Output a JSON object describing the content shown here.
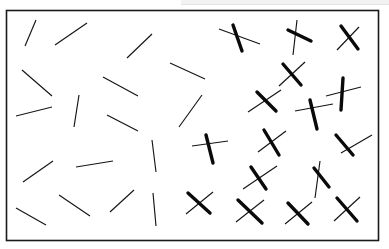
{
  "figure": {
    "canvas": {
      "width": 389,
      "height": 249
    },
    "background_color": "#ffffff",
    "top_band": {
      "name": "page-edge-band",
      "color": "#f2f2f2",
      "line_color": "#e2e2e2",
      "x": 181,
      "y": 0,
      "width": 208,
      "height": 5
    },
    "frame": {
      "name": "stimulus-frame",
      "x": 6.5,
      "y": 10.5,
      "width": 372,
      "height": 230,
      "stroke_color": "#1a1a1a",
      "stroke_width": 1.6,
      "fill_color": "#ffffff"
    },
    "stroke_styles": {
      "thin": {
        "color": "#141414",
        "width": 1.15
      },
      "thick": {
        "color": "#0a0a0a",
        "width": 3.4
      }
    },
    "region_labels": {
      "left": "single-line elements",
      "right": "cross (X) elements"
    }
  },
  "elements": {
    "thin_lines": [
      {
        "id": "line-01",
        "x1": 25,
        "y1": 46,
        "x2": 36,
        "y2": 20
      },
      {
        "id": "line-02",
        "x1": 55,
        "y1": 45,
        "x2": 87,
        "y2": 23
      },
      {
        "id": "line-03",
        "x1": 127,
        "y1": 58,
        "x2": 152,
        "y2": 34
      },
      {
        "id": "line-04",
        "x1": 170,
        "y1": 63,
        "x2": 205,
        "y2": 79
      },
      {
        "id": "line-05",
        "x1": 22,
        "y1": 70,
        "x2": 52,
        "y2": 96
      },
      {
        "id": "line-06",
        "x1": 103,
        "y1": 77,
        "x2": 138,
        "y2": 96
      },
      {
        "id": "line-07",
        "x1": 79,
        "y1": 95,
        "x2": 74,
        "y2": 127
      },
      {
        "id": "line-08",
        "x1": 16,
        "y1": 116,
        "x2": 52,
        "y2": 107
      },
      {
        "id": "line-09",
        "x1": 107,
        "y1": 115,
        "x2": 138,
        "y2": 131
      },
      {
        "id": "line-10",
        "x1": 179,
        "y1": 127,
        "x2": 202,
        "y2": 95
      },
      {
        "id": "line-11",
        "x1": 23,
        "y1": 182,
        "x2": 53,
        "y2": 161
      },
      {
        "id": "line-12",
        "x1": 76,
        "y1": 167,
        "x2": 113,
        "y2": 161
      },
      {
        "id": "line-13",
        "x1": 152,
        "y1": 140,
        "x2": 156,
        "y2": 172
      },
      {
        "id": "line-14",
        "x1": 16,
        "y1": 208,
        "x2": 46,
        "y2": 225
      },
      {
        "id": "line-15",
        "x1": 59,
        "y1": 195,
        "x2": 90,
        "y2": 216
      },
      {
        "id": "line-16",
        "x1": 110,
        "y1": 212,
        "x2": 134,
        "y2": 190
      },
      {
        "id": "line-17",
        "x1": 153,
        "y1": 193,
        "x2": 156,
        "y2": 226
      }
    ],
    "crosses": [
      {
        "id": "cross-01",
        "thick": {
          "x1": 233,
          "y1": 25,
          "x2": 242,
          "y2": 51
        },
        "thin": {
          "x1": 219,
          "y1": 29,
          "x2": 260,
          "y2": 44
        }
      },
      {
        "id": "cross-02",
        "thick": {
          "x1": 288,
          "y1": 30,
          "x2": 311,
          "y2": 41
        },
        "thin": {
          "x1": 297,
          "y1": 20,
          "x2": 293,
          "y2": 55
        }
      },
      {
        "id": "cross-03",
        "thick": {
          "x1": 341,
          "y1": 26,
          "x2": 358,
          "y2": 49
        },
        "thin": {
          "x1": 359,
          "y1": 27,
          "x2": 337,
          "y2": 50
        }
      },
      {
        "id": "cross-04",
        "thick": {
          "x1": 283,
          "y1": 64,
          "x2": 301,
          "y2": 85
        },
        "thin": {
          "x1": 305,
          "y1": 62,
          "x2": 279,
          "y2": 86
        }
      },
      {
        "id": "cross-05",
        "thick": {
          "x1": 257,
          "y1": 92,
          "x2": 276,
          "y2": 111
        },
        "thin": {
          "x1": 281,
          "y1": 90,
          "x2": 248,
          "y2": 112
        }
      },
      {
        "id": "cross-06",
        "thick": {
          "x1": 343,
          "y1": 78,
          "x2": 341,
          "y2": 110
        },
        "thin": {
          "x1": 326,
          "y1": 96,
          "x2": 361,
          "y2": 87
        }
      },
      {
        "id": "cross-07",
        "thick": {
          "x1": 310,
          "y1": 100,
          "x2": 317,
          "y2": 129
        },
        "thin": {
          "x1": 295,
          "y1": 111,
          "x2": 333,
          "y2": 104
        }
      },
      {
        "id": "cross-08",
        "thick": {
          "x1": 206,
          "y1": 135,
          "x2": 213,
          "y2": 163
        },
        "thin": {
          "x1": 192,
          "y1": 146,
          "x2": 228,
          "y2": 141
        }
      },
      {
        "id": "cross-09",
        "thick": {
          "x1": 264,
          "y1": 130,
          "x2": 279,
          "y2": 155
        },
        "thin": {
          "x1": 286,
          "y1": 131,
          "x2": 258,
          "y2": 152
        }
      },
      {
        "id": "cross-10",
        "thick": {
          "x1": 336,
          "y1": 135,
          "x2": 353,
          "y2": 155
        },
        "thin": {
          "x1": 341,
          "y1": 153,
          "x2": 372,
          "y2": 135
        }
      },
      {
        "id": "cross-11",
        "thick": {
          "x1": 251,
          "y1": 167,
          "x2": 266,
          "y2": 189
        },
        "thin": {
          "x1": 243,
          "y1": 189,
          "x2": 277,
          "y2": 166
        }
      },
      {
        "id": "cross-12",
        "thick": {
          "x1": 314,
          "y1": 168,
          "x2": 329,
          "y2": 187
        },
        "thin": {
          "x1": 320,
          "y1": 161,
          "x2": 315,
          "y2": 198
        }
      },
      {
        "id": "cross-13",
        "thick": {
          "x1": 188,
          "y1": 193,
          "x2": 210,
          "y2": 213
        },
        "thin": {
          "x1": 213,
          "y1": 192,
          "x2": 186,
          "y2": 214
        }
      },
      {
        "id": "cross-14",
        "thick": {
          "x1": 238,
          "y1": 200,
          "x2": 262,
          "y2": 223
        },
        "thin": {
          "x1": 264,
          "y1": 200,
          "x2": 236,
          "y2": 222
        }
      },
      {
        "id": "cross-15",
        "thick": {
          "x1": 288,
          "y1": 203,
          "x2": 308,
          "y2": 224
        },
        "thin": {
          "x1": 312,
          "y1": 202,
          "x2": 285,
          "y2": 224
        }
      },
      {
        "id": "cross-16",
        "thick": {
          "x1": 337,
          "y1": 198,
          "x2": 357,
          "y2": 221
        },
        "thin": {
          "x1": 360,
          "y1": 197,
          "x2": 334,
          "y2": 221
        }
      }
    ]
  }
}
